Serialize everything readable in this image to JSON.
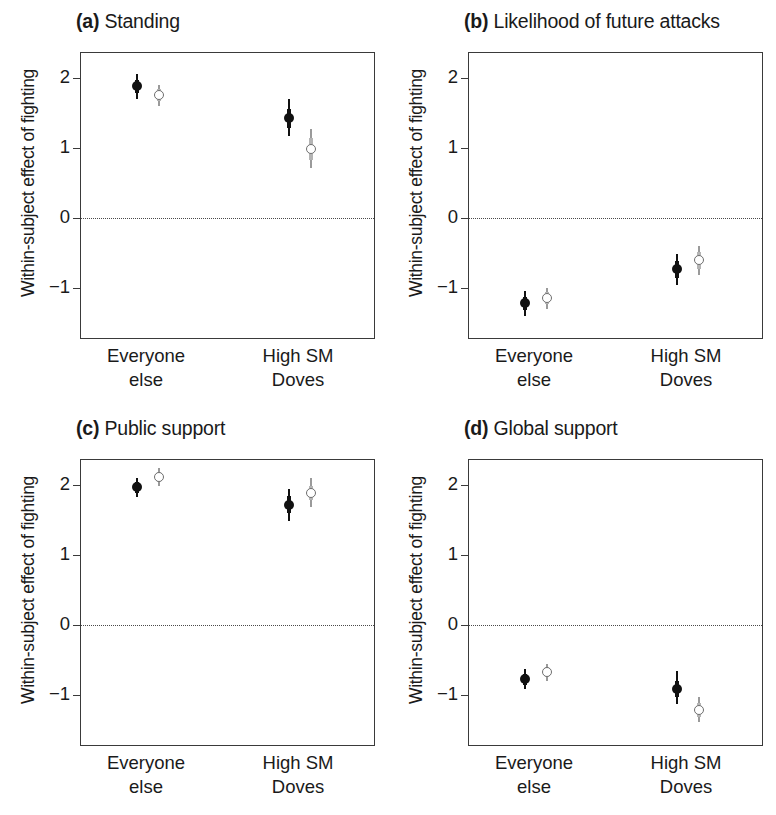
{
  "figure": {
    "panel_count": 4,
    "y_axis_label": "Within-subject effect of fighting",
    "group_labels": [
      "Everyone\nelse",
      "High SM\nDoves"
    ],
    "group_label_line1": [
      "Everyone",
      "High SM"
    ],
    "group_label_line2": [
      "else",
      "Doves"
    ],
    "ytick_labels": [
      "2",
      "1",
      "0",
      "−1"
    ],
    "colors": {
      "filled_marker": "#111111",
      "open_marker_outline": "#6e6e6e",
      "open_whisker": "#9a9a9a",
      "axis": "#3a3a3a",
      "zero_line": "#4a4a4a",
      "background": "#ffffff"
    }
  },
  "panels": [
    {
      "tag": "(a)",
      "title": "Standing"
    },
    {
      "tag": "(b)",
      "title": "Likelihood of future attacks"
    },
    {
      "tag": "(c)",
      "title": "Public support"
    },
    {
      "tag": "(d)",
      "title": "Global support"
    }
  ],
  "chart_data": [
    {
      "type": "scatter",
      "panel": "a",
      "title": "Standing",
      "xlabel": "",
      "ylabel": "Within-subject effect of fighting",
      "ylim": [
        -1.75,
        2.35
      ],
      "yticks": [
        2,
        1,
        0,
        -1
      ],
      "grid": false,
      "legend": "none",
      "reference_line": 0,
      "categories": [
        "Everyone else",
        "High SM Doves"
      ],
      "series": [
        {
          "name": "filled",
          "marker": "filled-circle",
          "values": [
            1.88,
            1.42
          ],
          "ci_inner_low": [
            1.78,
            1.28
          ],
          "ci_inner_high": [
            1.97,
            1.55
          ],
          "ci_outer_low": [
            1.7,
            1.17
          ],
          "ci_outer_high": [
            2.05,
            1.7
          ]
        },
        {
          "name": "open",
          "marker": "open-circle",
          "values": [
            1.75,
            0.98
          ],
          "ci_inner_low": [
            1.66,
            0.82
          ],
          "ci_inner_high": [
            1.84,
            1.14
          ],
          "ci_outer_low": [
            1.6,
            0.7
          ],
          "ci_outer_high": [
            1.9,
            1.26
          ]
        }
      ]
    },
    {
      "type": "scatter",
      "panel": "b",
      "title": "Likelihood of future attacks",
      "xlabel": "",
      "ylabel": "Within-subject effect of fighting",
      "ylim": [
        -1.75,
        2.35
      ],
      "yticks": [
        2,
        1,
        0,
        -1
      ],
      "grid": false,
      "legend": "none",
      "reference_line": 0,
      "categories": [
        "Everyone else",
        "High SM Doves"
      ],
      "series": [
        {
          "name": "filled",
          "marker": "filled-circle",
          "values": [
            -1.22,
            -0.74
          ],
          "ci_inner_low": [
            -1.32,
            -0.86
          ],
          "ci_inner_high": [
            -1.13,
            -0.62
          ],
          "ci_outer_low": [
            -1.4,
            -0.96
          ],
          "ci_outer_high": [
            -1.05,
            -0.52
          ]
        },
        {
          "name": "open",
          "marker": "open-circle",
          "values": [
            -1.15,
            -0.61
          ],
          "ci_inner_low": [
            -1.24,
            -0.73
          ],
          "ci_inner_high": [
            -1.07,
            -0.49
          ],
          "ci_outer_low": [
            -1.31,
            -0.82
          ],
          "ci_outer_high": [
            -1.0,
            -0.4
          ]
        }
      ]
    },
    {
      "type": "scatter",
      "panel": "c",
      "title": "Public support",
      "xlabel": "",
      "ylabel": "Within-subject effect of fighting",
      "ylim": [
        -1.75,
        2.35
      ],
      "yticks": [
        2,
        1,
        0,
        -1
      ],
      "grid": false,
      "legend": "none",
      "reference_line": 0,
      "categories": [
        "Everyone else",
        "High SM Doves"
      ],
      "series": [
        {
          "name": "filled",
          "marker": "filled-circle",
          "values": [
            1.96,
            1.71
          ],
          "ci_inner_low": [
            1.88,
            1.59
          ],
          "ci_inner_high": [
            2.04,
            1.83
          ],
          "ci_outer_low": [
            1.82,
            1.48
          ],
          "ci_outer_high": [
            2.1,
            1.94
          ]
        },
        {
          "name": "open",
          "marker": "open-circle",
          "values": [
            2.11,
            1.88
          ],
          "ci_inner_low": [
            2.04,
            1.78
          ],
          "ci_inner_high": [
            2.18,
            1.98
          ],
          "ci_outer_low": [
            1.98,
            1.68
          ],
          "ci_outer_high": [
            2.24,
            2.1
          ]
        }
      ]
    },
    {
      "type": "scatter",
      "panel": "d",
      "title": "Global support",
      "xlabel": "",
      "ylabel": "Within-subject effect of fighting",
      "ylim": [
        -1.75,
        2.35
      ],
      "yticks": [
        2,
        1,
        0,
        -1
      ],
      "grid": false,
      "legend": "none",
      "reference_line": 0,
      "categories": [
        "Everyone else",
        "High SM Doves"
      ],
      "series": [
        {
          "name": "filled",
          "marker": "filled-circle",
          "values": [
            -0.78,
            -0.92
          ],
          "ci_inner_low": [
            -0.86,
            -1.04
          ],
          "ci_inner_high": [
            -0.7,
            -0.8
          ],
          "ci_outer_low": [
            -0.92,
            -1.14
          ],
          "ci_outer_high": [
            -0.64,
            -0.66
          ]
        },
        {
          "name": "open",
          "marker": "open-circle",
          "values": [
            -0.68,
            -1.22
          ],
          "ci_inner_low": [
            -0.75,
            -1.32
          ],
          "ci_inner_high": [
            -0.61,
            -1.12
          ],
          "ci_outer_low": [
            -0.81,
            -1.4
          ],
          "ci_outer_high": [
            -0.56,
            -1.03
          ]
        }
      ]
    }
  ]
}
